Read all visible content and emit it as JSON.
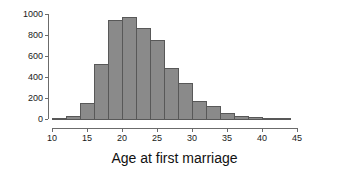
{
  "chart_data": {
    "type": "bar",
    "title": "",
    "subtitle": "",
    "xlabel": "Age at first marriage",
    "ylabel": "",
    "xlim": [
      10,
      45
    ],
    "ylim": [
      0,
      1000
    ],
    "grid": false,
    "legend": null,
    "bin_width": 2,
    "bar_color": "#8a8a8a",
    "bar_edge_color": "#585858",
    "axis_color": "#6b6b6b",
    "x_ticks": [
      10,
      15,
      20,
      25,
      30,
      35,
      40,
      45
    ],
    "x_tick_labels": [
      "10",
      "15",
      "20",
      "25",
      "30",
      "35",
      "40",
      "45"
    ],
    "y_ticks": [
      0,
      200,
      400,
      600,
      800,
      1000
    ],
    "y_tick_labels": [
      "0",
      "200",
      "400",
      "600",
      "800",
      "1000"
    ],
    "categories": [
      "10-12",
      "12-14",
      "14-16",
      "16-18",
      "18-20",
      "20-22",
      "22-24",
      "24-26",
      "26-28",
      "28-30",
      "30-32",
      "32-34",
      "34-36",
      "36-38",
      "38-40",
      "40-42",
      "42-44"
    ],
    "bin_starts": [
      10,
      12,
      14,
      16,
      18,
      20,
      22,
      24,
      26,
      28,
      30,
      32,
      34,
      36,
      38,
      40,
      42
    ],
    "bin_ends": [
      12,
      14,
      16,
      18,
      20,
      22,
      24,
      26,
      28,
      30,
      32,
      34,
      36,
      38,
      40,
      42,
      44
    ],
    "values": [
      5,
      25,
      150,
      520,
      935,
      965,
      860,
      750,
      480,
      340,
      165,
      115,
      48,
      28,
      15,
      8,
      3
    ]
  }
}
